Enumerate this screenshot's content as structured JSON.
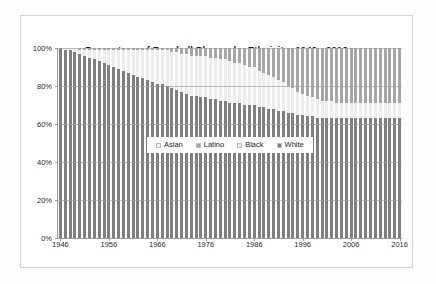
{
  "chart_data": {
    "type": "bar",
    "subtype": "100% stacked column",
    "title": "Percentage of Baseball Players by Ethnicity: 1946 - 2016",
    "xlabel": "",
    "ylabel": "",
    "ylim": [
      0,
      100
    ],
    "ytick_labels": [
      "0%",
      "20%",
      "40%",
      "60%",
      "80%",
      "100%"
    ],
    "ytick_values": [
      0,
      20,
      40,
      60,
      80,
      100
    ],
    "xtick_labels": [
      "1946",
      "1956",
      "1966",
      "1976",
      "1986",
      "1996",
      "2006",
      "2016"
    ],
    "xtick_values": [
      1946,
      1956,
      1966,
      1976,
      1986,
      1996,
      2006,
      2016
    ],
    "grid": true,
    "legend_position": "center-inside",
    "legend": [
      "Asian",
      "Latino",
      "Black",
      "White"
    ],
    "colors": {
      "Asian": "#f2f2f2",
      "Latino": "#a6a6a6",
      "Black": "#ededed",
      "White": "#7f7f7f",
      "gridline": "#9e9e9e",
      "plot_background": "#ffffff",
      "title_text": "#1a1a1a",
      "tick_text": "#2b2b2b",
      "frame_border": "#d4d4d4"
    },
    "x": [
      1946,
      1947,
      1948,
      1949,
      1950,
      1951,
      1952,
      1953,
      1954,
      1955,
      1956,
      1957,
      1958,
      1959,
      1960,
      1961,
      1962,
      1963,
      1964,
      1965,
      1966,
      1967,
      1968,
      1969,
      1970,
      1971,
      1972,
      1973,
      1974,
      1975,
      1976,
      1977,
      1978,
      1979,
      1980,
      1981,
      1982,
      1983,
      1984,
      1985,
      1986,
      1987,
      1988,
      1989,
      1990,
      1991,
      1992,
      1993,
      1994,
      1995,
      1996,
      1997,
      1998,
      1999,
      2000,
      2001,
      2002,
      2003,
      2004,
      2005,
      2006,
      2007,
      2008,
      2009,
      2010,
      2011,
      2012,
      2013,
      2014,
      2015,
      2016
    ],
    "series": [
      {
        "name": "White",
        "values": [
          100,
          99,
          99,
          98,
          97,
          96,
          95,
          94,
          93,
          92,
          91,
          90,
          89,
          88,
          87,
          86,
          85,
          84,
          83,
          82,
          81,
          81,
          80,
          79,
          78,
          77,
          76,
          75,
          75,
          74,
          74,
          73,
          73,
          72,
          72,
          71,
          71,
          71,
          70,
          70,
          70,
          69,
          69,
          68,
          68,
          67,
          67,
          66,
          66,
          65,
          65,
          64,
          64,
          63,
          63,
          63,
          63,
          63,
          63,
          63,
          63,
          63,
          63,
          63,
          63,
          63,
          63,
          63,
          63,
          63,
          63
        ]
      },
      {
        "name": "Black",
        "values": [
          0,
          1,
          1,
          2,
          2,
          3,
          4,
          5,
          6,
          7,
          8,
          9,
          10,
          11,
          12,
          13,
          14,
          15,
          16,
          17,
          18,
          18,
          19,
          19,
          20,
          20,
          21,
          21,
          21,
          22,
          22,
          22,
          22,
          22,
          22,
          22,
          21,
          21,
          21,
          20,
          20,
          19,
          18,
          18,
          17,
          16,
          15,
          14,
          13,
          12,
          11,
          11,
          10,
          10,
          9,
          9,
          9,
          8,
          8,
          8,
          8,
          8,
          8,
          8,
          8,
          8,
          8,
          8,
          8,
          8,
          8
        ]
      },
      {
        "name": "Latino",
        "values": [
          0,
          0,
          0,
          0,
          1,
          1,
          1,
          1,
          1,
          1,
          1,
          1,
          1,
          1,
          1,
          1,
          1,
          1,
          1,
          1,
          1,
          1,
          1,
          2,
          2,
          3,
          3,
          4,
          4,
          4,
          4,
          5,
          5,
          6,
          6,
          7,
          8,
          8,
          9,
          10,
          10,
          12,
          13,
          14,
          15,
          17,
          18,
          20,
          21,
          23,
          24,
          25,
          26,
          27,
          28,
          28,
          28,
          29,
          29,
          29,
          29,
          29,
          29,
          29,
          29,
          29,
          29,
          29,
          29,
          29,
          29
        ]
      },
      {
        "name": "Asian",
        "values": [
          0,
          0,
          0,
          0,
          0,
          0,
          0,
          0,
          0,
          0,
          0,
          0,
          0,
          0,
          0,
          0,
          0,
          0,
          0,
          0,
          0,
          0,
          0,
          0,
          0,
          0,
          0,
          0,
          0,
          0,
          0,
          0,
          0,
          0,
          0,
          0,
          0,
          0,
          0,
          0,
          0,
          0,
          0,
          0,
          0,
          0,
          0,
          0,
          0,
          0,
          0,
          0,
          0,
          0,
          0,
          0,
          0,
          0,
          0,
          0,
          0,
          0,
          0,
          0,
          0,
          0,
          0,
          0,
          0,
          0,
          0
        ]
      }
    ]
  }
}
